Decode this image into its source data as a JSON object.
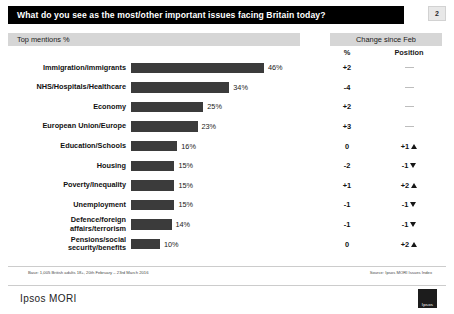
{
  "slide": {
    "title": "What do you see as the most/other important issues facing Britain today?",
    "page_number": "2",
    "band_left_label": "Top mentions %",
    "band_right_label": "Change since Feb",
    "column_pct": "%",
    "column_position": "Position",
    "footnote_left": "Base: 1,005 British adults 18+, 20th February – 23rd March 2016",
    "footnote_right": "Source: Ipsos MORI Issues Index",
    "brand": "Ipsos MORI",
    "logo_text": "Ipsos"
  },
  "chart_data": {
    "type": "bar",
    "title": "What do you see as the most/other important issues facing Britain today?",
    "xlabel": "",
    "ylabel": "",
    "xlim": [
      0,
      50
    ],
    "grid": false,
    "orientation": "horizontal",
    "value_suffix": "%",
    "categories": [
      "Immigration/immigrants",
      "NHS/Hospitals/Healthcare",
      "Economy",
      "European Union/Europe",
      "Education/Schools",
      "Housing",
      "Poverty/Inequality",
      "Unemployment",
      "Defence/foreign affairs/terrorism",
      "Pensions/social security/benefits"
    ],
    "values": [
      46,
      34,
      25,
      23,
      16,
      15,
      15,
      15,
      14,
      10
    ],
    "value_labels": [
      "46%",
      "34%",
      "25%",
      "23%",
      "16%",
      "15%",
      "15%",
      "15%",
      "14%",
      "10%"
    ],
    "change_pct": [
      "+2",
      "-4",
      "+2",
      "+3",
      "0",
      "-2",
      "+1",
      "-1",
      "-1",
      "0"
    ],
    "change_position": [
      "",
      "",
      "",
      "",
      "+1",
      "-1",
      "+2",
      "-1",
      "-1",
      "+2"
    ],
    "change_direction": [
      "none",
      "none",
      "none",
      "none",
      "up",
      "down",
      "up",
      "down",
      "down",
      "up"
    ],
    "bar_color": "#3b3b3b"
  },
  "rows": [
    {
      "label": "Immigration/immigrants",
      "value_label": "46%",
      "value": 46,
      "chg": "+2",
      "pos": "",
      "dir": "none"
    },
    {
      "label": "NHS/Hospitals/Healthcare",
      "value_label": "34%",
      "value": 34,
      "chg": "-4",
      "pos": "",
      "dir": "none"
    },
    {
      "label": "Economy",
      "value_label": "25%",
      "value": 25,
      "chg": "+2",
      "pos": "",
      "dir": "none"
    },
    {
      "label": "European Union/Europe",
      "value_label": "23%",
      "value": 23,
      "chg": "+3",
      "pos": "",
      "dir": "none"
    },
    {
      "label": "Education/Schools",
      "value_label": "16%",
      "value": 16,
      "chg": "0",
      "pos": "+1",
      "dir": "up"
    },
    {
      "label": "Housing",
      "value_label": "15%",
      "value": 15,
      "chg": "-2",
      "pos": "-1",
      "dir": "down"
    },
    {
      "label": "Poverty/Inequality",
      "value_label": "15%",
      "value": 15,
      "chg": "+1",
      "pos": "+2",
      "dir": "up"
    },
    {
      "label": "Unemployment",
      "value_label": "15%",
      "value": 15,
      "chg": "-1",
      "pos": "-1",
      "dir": "down"
    },
    {
      "label": "Defence/foreign\naffairs/terrorism",
      "value_label": "14%",
      "value": 14,
      "chg": "-1",
      "pos": "-1",
      "dir": "down"
    },
    {
      "label": "Pensions/social\nsecurity/benefits",
      "value_label": "10%",
      "value": 10,
      "chg": "0",
      "pos": "+2",
      "dir": "up"
    }
  ]
}
